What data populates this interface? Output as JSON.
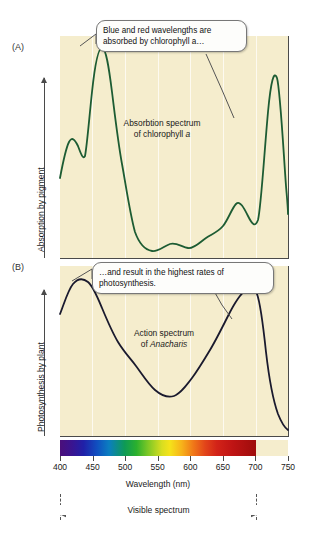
{
  "figure": {
    "header_fragment": "",
    "panels": [
      {
        "letter": "(A)",
        "ylabel": "Absorption by pigment",
        "note_line1": "Absorbtion spectrum",
        "note_line2_pre": "of chlorophyll ",
        "note_line2_ital": "a"
      },
      {
        "letter": "(B)",
        "ylabel": "Photosynthesis by plant",
        "note_line1": "Action spectrum",
        "note_line2_pre": "of ",
        "note_line2_ital": "Anacharis"
      }
    ],
    "callouts": [
      {
        "name": "callout-absorption",
        "text": "Blue and red wavelengths are absorbed by chlorophyll a…"
      },
      {
        "name": "callout-photosynthesis",
        "text": "…and result in the highest rates of photosynthesis."
      }
    ],
    "xaxis": {
      "label": "Wavelength (nm)",
      "ticks": [
        400,
        450,
        500,
        550,
        600,
        650,
        700,
        750
      ]
    },
    "visible_spectrum": {
      "label": "Visible spectrum",
      "start": 400,
      "end": 700
    },
    "colors": {
      "plot_background": "#f5edcd",
      "absorption_curve": "#1d5c33",
      "action_curve": "#1a1a2e",
      "axis": "#4a4a4a",
      "callout_background": "#fdfdfb"
    }
  },
  "chart_data": [
    {
      "type": "line",
      "title": "Absorbtion spectrum of chlorophyll a",
      "panel": "(A)",
      "xlabel": "Wavelength (nm)",
      "ylabel": "Absorption by pigment",
      "xlim": [
        400,
        750
      ],
      "ylim": [
        0,
        100
      ],
      "grid": true,
      "series": [
        {
          "name": "Absorption spectrum of chlorophyll a",
          "color": "#1d5c33",
          "x": [
            400,
            405,
            410,
            415,
            420,
            425,
            430,
            435,
            440,
            450,
            460,
            470,
            480,
            490,
            500,
            520,
            540,
            550,
            560,
            580,
            600,
            610,
            620,
            630,
            640,
            650,
            660,
            665,
            670,
            680,
            690,
            700,
            710,
            720
          ],
          "y": [
            36,
            48,
            44,
            38,
            52,
            82,
            97,
            88,
            70,
            40,
            22,
            13,
            9,
            7,
            6,
            5,
            7,
            8,
            7,
            6,
            9,
            14,
            18,
            17,
            14,
            18,
            55,
            86,
            80,
            40,
            17,
            10,
            8,
            7
          ]
        }
      ]
    },
    {
      "type": "line",
      "title": "Action spectrum of Anacharis",
      "panel": "(B)",
      "xlabel": "Wavelength (nm)",
      "ylabel": "Photosynthesis by plant",
      "xlim": [
        400,
        750
      ],
      "ylim": [
        0,
        100
      ],
      "grid": true,
      "series": [
        {
          "name": "Action spectrum of Anacharis",
          "color": "#1a1a2e",
          "x": [
            400,
            410,
            420,
            430,
            435,
            440,
            450,
            460,
            470,
            480,
            490,
            500,
            510,
            520,
            530,
            540,
            550,
            560,
            570,
            580,
            590,
            600,
            610,
            620,
            630,
            640,
            650,
            660,
            670,
            675,
            680,
            690,
            700,
            710,
            720
          ],
          "y": [
            72,
            84,
            90,
            92,
            92,
            90,
            84,
            74,
            64,
            55,
            48,
            42,
            37,
            32,
            27,
            23,
            21,
            22,
            26,
            32,
            36,
            41,
            47,
            55,
            64,
            72,
            80,
            87,
            91,
            92,
            88,
            70,
            40,
            20,
            12
          ]
        }
      ]
    }
  ]
}
